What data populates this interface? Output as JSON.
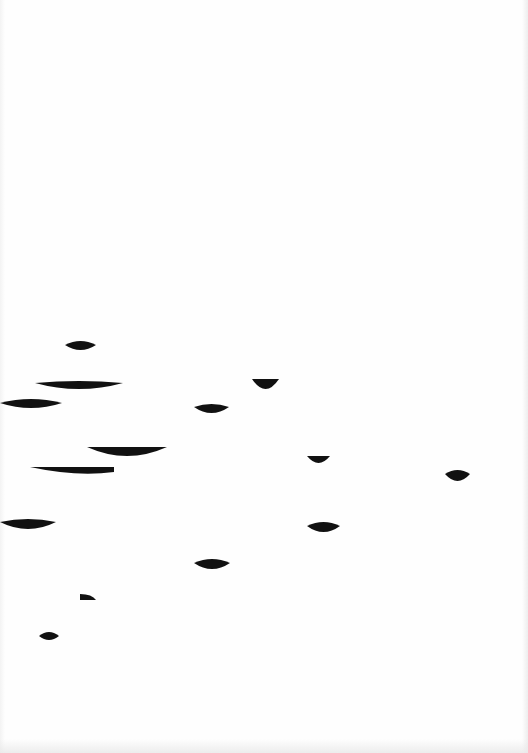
{
  "page": {
    "width": 528,
    "height": 753,
    "background": "#fefefe",
    "ink_color": "#111111"
  },
  "artwork": {
    "description": "Scanned page with black crescent / leaf-like shapes scattered across the middle",
    "shapes": [
      {
        "id": "shape-1",
        "type": "lens",
        "x1": 65,
        "x2": 96,
        "yc": 345,
        "h_top": 4,
        "h_bot": 5
      },
      {
        "id": "shape-2",
        "type": "lens",
        "x1": 35,
        "x2": 123,
        "yc": 383,
        "h_top": 2,
        "h_bot": 6
      },
      {
        "id": "shape-3",
        "type": "lens",
        "x1": 0,
        "x2": 62,
        "yc": 403,
        "h_top": 4,
        "h_bot": 5
      },
      {
        "id": "shape-4",
        "type": "crescent",
        "x1": 87,
        "x2": 167,
        "ytop": 447,
        "depth": 9
      },
      {
        "id": "shape-5",
        "type": "blade",
        "x1": 30,
        "x2": 114,
        "ytop": 467,
        "depth": 8
      },
      {
        "id": "shape-6",
        "type": "lens",
        "x1": 0,
        "x2": 56,
        "yc": 522,
        "h_top": 3,
        "h_bot": 7
      },
      {
        "id": "shape-7",
        "type": "crescent",
        "x1": 252,
        "x2": 279,
        "ytop": 379,
        "depth": 10
      },
      {
        "id": "shape-8",
        "type": "lens",
        "x1": 194,
        "x2": 229,
        "yc": 407,
        "h_top": 3,
        "h_bot": 6
      },
      {
        "id": "shape-9",
        "type": "crescent",
        "x1": 307,
        "x2": 330,
        "ytop": 456,
        "depth": 7
      },
      {
        "id": "shape-10",
        "type": "lens",
        "x1": 445,
        "x2": 470,
        "yc": 474,
        "h_top": 4,
        "h_bot": 7
      },
      {
        "id": "shape-11",
        "type": "lens",
        "x1": 307,
        "x2": 340,
        "yc": 526,
        "h_top": 4,
        "h_bot": 6
      },
      {
        "id": "shape-12",
        "type": "lens",
        "x1": 194,
        "x2": 230,
        "yc": 563,
        "h_top": 4,
        "h_bot": 6
      },
      {
        "id": "shape-13",
        "type": "wedge",
        "x1": 80,
        "x2": 96,
        "yc": 597,
        "h_top": 3,
        "h_bot": 3
      },
      {
        "id": "shape-14",
        "type": "lens",
        "x1": 39,
        "x2": 59,
        "yc": 636,
        "h_top": 4,
        "h_bot": 4
      }
    ]
  }
}
